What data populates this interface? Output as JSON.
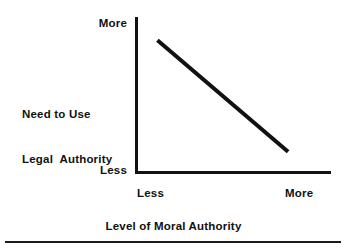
{
  "figure": {
    "background_color": "#ffffff",
    "ink_color": "#111111",
    "width": 347,
    "height": 252
  },
  "chart_data": {
    "type": "line",
    "title": "",
    "subtitle": "",
    "xlabel": "Level of Moral Authority",
    "ylabel": "Need to Use Legal Authority",
    "ylabel_lines": [
      "Need to Use",
      "Legal  Authority"
    ],
    "xticklabels": [
      "Less",
      "More"
    ],
    "yticklabels": [
      "Less",
      "More"
    ],
    "xlim": [
      0,
      1
    ],
    "ylim": [
      0,
      1
    ],
    "grid": false,
    "legend": null,
    "annotations": [],
    "series": [
      {
        "name": "inverse relationship",
        "color": "#111111",
        "linewidth": 4,
        "x": [
          0.11,
          0.78
        ],
        "y": [
          0.85,
          0.13
        ],
        "points": [
          {
            "x": 0.11,
            "y": 0.85
          },
          {
            "x": 0.78,
            "y": 0.13
          }
        ]
      }
    ]
  },
  "axes": {
    "y_axis_top_label": "More",
    "y_axis_bottom_label": "Less",
    "x_axis_left_label": "Less",
    "x_axis_right_label": "More",
    "x_axis_title": "Level of Moral Authority",
    "y_axis_title_line1": "Need to Use",
    "y_axis_title_line2": "Legal  Authority"
  },
  "decor": {
    "bottom_rule_color": "#1a1a1a"
  }
}
